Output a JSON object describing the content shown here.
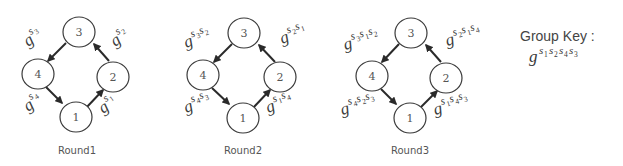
{
  "diagram": {
    "rounds": [
      {
        "label": "Round1",
        "nodes": [
          "1",
          "2",
          "3",
          "4"
        ],
        "edges": [
          {
            "from": "1",
            "to": "2",
            "label_base": "g",
            "label_exponent": [
              "1"
            ]
          },
          {
            "from": "2",
            "to": "3",
            "label_base": "g",
            "label_exponent": [
              "2"
            ]
          },
          {
            "from": "3",
            "to": "4",
            "label_base": "g",
            "label_exponent": [
              "3"
            ]
          },
          {
            "from": "4",
            "to": "1",
            "label_base": "g",
            "label_exponent": [
              "4"
            ]
          }
        ]
      },
      {
        "label": "Round2",
        "nodes": [
          "1",
          "2",
          "3",
          "4"
        ],
        "edges": [
          {
            "from": "1",
            "to": "2",
            "label_base": "g",
            "label_exponent": [
              "1",
              "4"
            ]
          },
          {
            "from": "2",
            "to": "3",
            "label_base": "g",
            "label_exponent": [
              "2",
              "1"
            ]
          },
          {
            "from": "3",
            "to": "4",
            "label_base": "g",
            "label_exponent": [
              "3",
              "2"
            ]
          },
          {
            "from": "4",
            "to": "1",
            "label_base": "g",
            "label_exponent": [
              "4",
              "3"
            ]
          }
        ]
      },
      {
        "label": "Round3",
        "nodes": [
          "1",
          "2",
          "3",
          "4"
        ],
        "edges": [
          {
            "from": "1",
            "to": "2",
            "label_base": "g",
            "label_exponent": [
              "1",
              "4",
              "3"
            ]
          },
          {
            "from": "2",
            "to": "3",
            "label_base": "g",
            "label_exponent": [
              "2",
              "1",
              "4"
            ]
          },
          {
            "from": "3",
            "to": "4",
            "label_base": "g",
            "label_exponent": [
              "3",
              "1",
              "2"
            ]
          },
          {
            "from": "4",
            "to": "1",
            "label_base": "g",
            "label_exponent": [
              "4",
              "2",
              "3"
            ]
          }
        ]
      }
    ],
    "group_key": {
      "title": "Group Key :",
      "base": "g",
      "exponent": [
        "1",
        "2",
        "4",
        "3"
      ]
    },
    "exponent_symbol": "s",
    "colors": {
      "stroke": "#3a3a3a",
      "arrow": "#2a2a2a",
      "text": "#555555",
      "background": "#ffffff"
    }
  }
}
